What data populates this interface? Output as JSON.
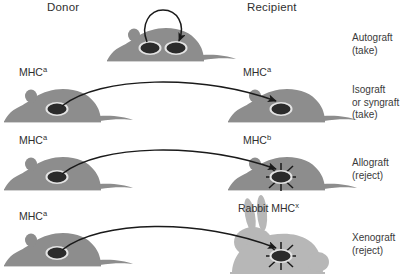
{
  "figure": {
    "title_columns": {
      "donor": "Donor",
      "recipient": "Recipient"
    },
    "colors": {
      "mouse_fill": "#8d8d8d",
      "rabbit_fill": "#b7b7b7",
      "graft_dark": "#2b2b2b",
      "graft_outline": "#e4e4e4",
      "arrow": "#1a1a1a",
      "text": "#2f2f2f",
      "background": "#ffffff"
    },
    "rows": [
      {
        "id": "autograft",
        "donor_label": "",
        "donor_sup": "",
        "recipient_label": "",
        "recipient_sup": "",
        "outcome_line1": "Autograft",
        "outcome_line2": "(take)",
        "graft_state": "take",
        "animal_donor": "mouse",
        "animal_recipient": "mouse",
        "arrow_type": "loop",
        "same_animal": true
      },
      {
        "id": "isograft",
        "donor_label": "MHC",
        "donor_sup": "a",
        "recipient_label": "MHC",
        "recipient_sup": "a",
        "outcome_line1": "Isograft",
        "outcome_line2": "or syngraft",
        "outcome_line3": "(take)",
        "graft_state": "take",
        "animal_donor": "mouse",
        "animal_recipient": "mouse",
        "arrow_type": "curve",
        "same_animal": false
      },
      {
        "id": "allograft",
        "donor_label": "MHC",
        "donor_sup": "a",
        "recipient_label": "MHC",
        "recipient_sup": "b",
        "outcome_line1": "Allograft",
        "outcome_line2": "(reject)",
        "graft_state": "reject",
        "animal_donor": "mouse",
        "animal_recipient": "mouse",
        "arrow_type": "curve",
        "same_animal": false
      },
      {
        "id": "xenograft",
        "donor_label": "MHC",
        "donor_sup": "a",
        "recipient_label": "Rabbit MHC",
        "recipient_sup": "x",
        "outcome_line1": "Xenograft",
        "outcome_line2": "(reject)",
        "graft_state": "reject",
        "animal_donor": "mouse",
        "animal_recipient": "rabbit",
        "arrow_type": "curve",
        "same_animal": false
      }
    ]
  }
}
